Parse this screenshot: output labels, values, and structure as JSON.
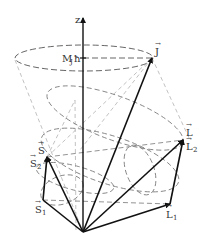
{
  "figure": {
    "type": "vector-coupling-diagram"
  },
  "labels": {
    "z_axis": "z",
    "projection": "M",
    "projection_sub": "J",
    "projection_hbar": "ħ",
    "J": "J",
    "L": "L",
    "L2": "L",
    "L2_sub": "2",
    "L1": "L",
    "L1_sub": "1",
    "S": "S",
    "S2": "S",
    "S2_sub": "2",
    "S1": "S",
    "S1_sub": "1",
    "vec_arrow": "→"
  },
  "colors": {
    "solid": "#111111",
    "dashed": "#777777",
    "text": "#333333"
  }
}
